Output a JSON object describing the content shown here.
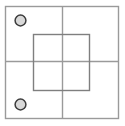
{
  "canvas": {
    "width": 125,
    "height": 126,
    "background": "#ffffff",
    "title": "Square plate schematic with quadrant lines and two circular holes"
  },
  "style": {
    "outer_stroke": "#9a9a9a",
    "grid_stroke": "#9a9a9a",
    "inner_stroke": "#7f7f7f",
    "circle_fill": "#d9d9d9",
    "circle_stroke": "#3c3c3c",
    "stroke_width": 1.4,
    "circle_stroke_width": 1.5
  },
  "shapes": {
    "outer_square": {
      "name": "outer-boundary",
      "x": 5.5,
      "y": 6.5,
      "width": 113,
      "height": 112,
      "fill": "none"
    },
    "inner_square": {
      "name": "inner-boundary",
      "x": 33.5,
      "y": 34.5,
      "width": 56,
      "height": 56,
      "fill": "none"
    },
    "center_vertical_line": {
      "name": "vertical-center-line",
      "x1": 62.5,
      "y1": 6.5,
      "x2": 62.5,
      "y2": 118.5
    },
    "center_horizontal_line": {
      "name": "horizontal-center-line",
      "x1": 5.5,
      "y1": 61.5,
      "x2": 118.5,
      "y2": 61.5
    },
    "circles": [
      {
        "name": "hole-top-left",
        "cx": 20.5,
        "cy": 20.5,
        "r": 5.4
      },
      {
        "name": "hole-bottom-left",
        "cx": 20.5,
        "cy": 104.5,
        "r": 5.4
      }
    ]
  }
}
